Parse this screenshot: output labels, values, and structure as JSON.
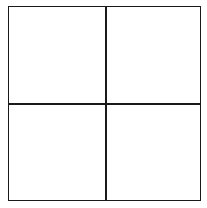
{
  "diagram": {
    "type": "grid",
    "rows": 2,
    "columns": 2,
    "cells": [
      {
        "row": 0,
        "col": 0,
        "label": ""
      },
      {
        "row": 0,
        "col": 1,
        "label": ""
      },
      {
        "row": 1,
        "col": 0,
        "label": ""
      },
      {
        "row": 1,
        "col": 1,
        "label": ""
      }
    ],
    "line_color": "#1a1a1a",
    "background_color": "#ffffff"
  }
}
